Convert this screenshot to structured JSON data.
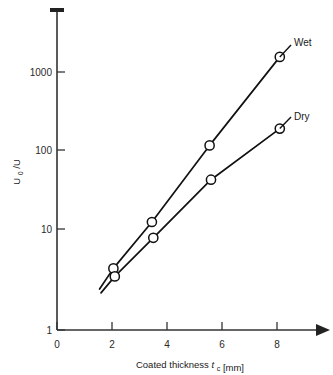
{
  "chart_data": {
    "type": "line",
    "title": "",
    "subtitle": "",
    "xlabel": "Coated thickness t_c [mm]",
    "ylabel": "U_0/U",
    "yscale": "log",
    "xscale": "linear",
    "xlim": [
      0,
      9.2
    ],
    "ylim": [
      1,
      3000
    ],
    "xticks": [
      0,
      2,
      4,
      6,
      8
    ],
    "xtick_labels": [
      "0",
      "2",
      "4",
      "6",
      "8"
    ],
    "yticks": [
      1,
      10,
      100,
      1000
    ],
    "ytick_labels": [
      "1",
      "10",
      "100",
      "1000"
    ],
    "grid": false,
    "legend_position": "inline-right-annotation",
    "series": [
      {
        "name": "Wet",
        "x": [
          1.55,
          2.05,
          3.45,
          5.55,
          8.1
        ],
        "values": [
          3.0,
          5.2,
          18.0,
          140.0,
          1500.0
        ],
        "markers_from_index": 1,
        "marker": "open-circle"
      },
      {
        "name": "Dry",
        "x": [
          1.6,
          2.1,
          3.5,
          5.6,
          8.1
        ],
        "values": [
          2.7,
          4.2,
          11.8,
          56.0,
          220.0
        ],
        "markers_from_index": 1,
        "marker": "open-circle"
      }
    ],
    "annotations": [
      {
        "text": "Wet",
        "attached_to_series": "Wet",
        "at_point_index": 4
      },
      {
        "text": "Dry",
        "attached_to_series": "Dry",
        "at_point_index": 4
      }
    ]
  },
  "axis": {
    "x_label_main": "Coated thickness",
    "x_label_var": "t",
    "x_label_sub": "c",
    "x_label_unit": "[mm]",
    "y_label_var": "U",
    "y_label_sub": "0",
    "y_label_rest": "/U"
  },
  "colors": {
    "axis": "#333333",
    "curve": "#111111",
    "marker_fill": "#ffffff",
    "background": "#ffffff",
    "text": "#1a1a1a"
  }
}
